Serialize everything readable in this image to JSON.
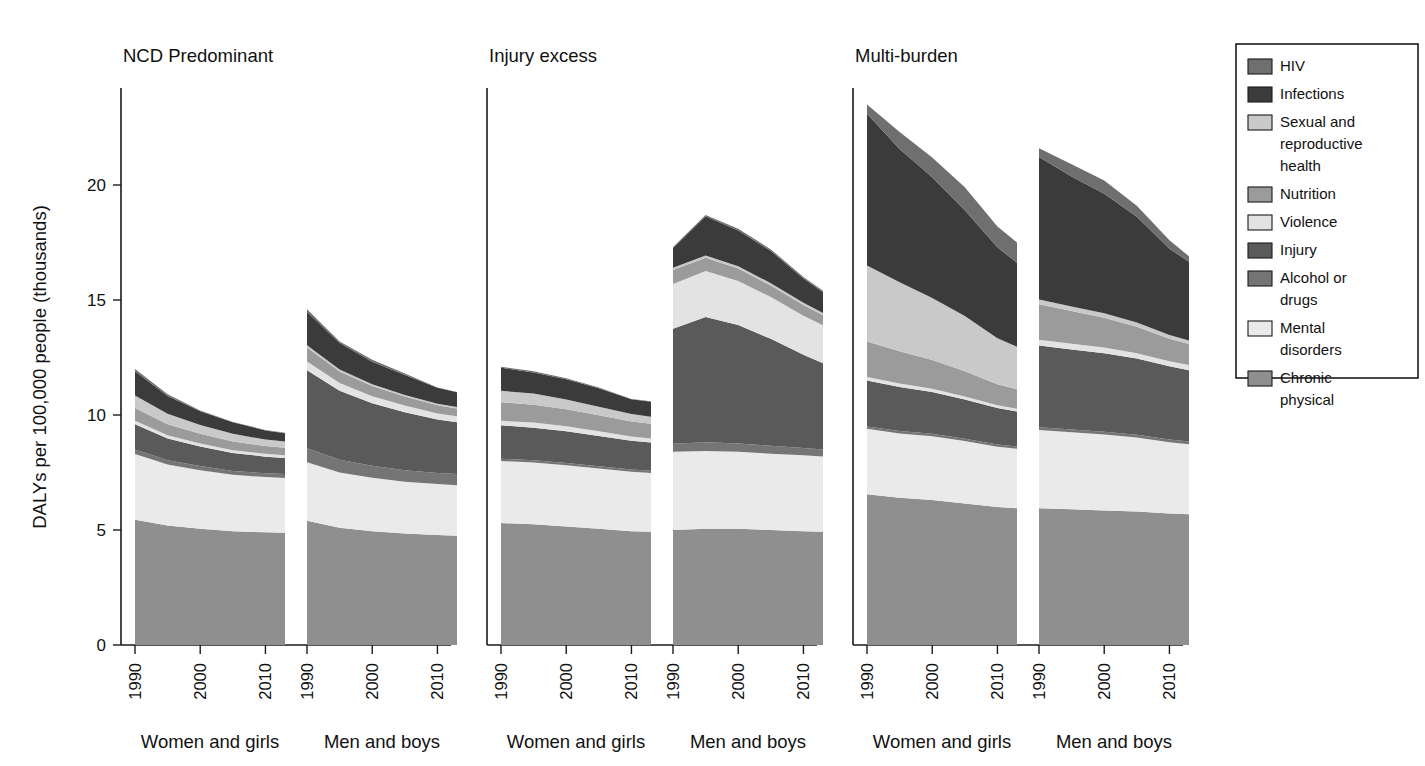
{
  "figure": {
    "ylabel": "DALYs per 100,000 people (thousands)",
    "panels": [
      {
        "title": "NCD Predominant",
        "groups": [
          "Women and girls",
          "Men and boys"
        ]
      },
      {
        "title": "Injury excess",
        "groups": [
          "Women and girls",
          "Men and boys"
        ]
      },
      {
        "title": "Multi-burden",
        "groups": [
          "Women and girls",
          "Men and boys"
        ]
      }
    ],
    "xticklabels": [
      "1990",
      "2000",
      "2010"
    ],
    "yticklabels": [
      "0",
      "5",
      "10",
      "15",
      "20"
    ]
  },
  "legend": {
    "title": "",
    "items": [
      {
        "label": "HIV",
        "color": "#6f6f6f"
      },
      {
        "label": "Infections",
        "color": "#3b3b3b"
      },
      {
        "label": "Sexual and reproductive health",
        "color": "#c9c9c9"
      },
      {
        "label": "Nutrition",
        "color": "#9b9b9b"
      },
      {
        "label": "Violence",
        "color": "#e3e3e3"
      },
      {
        "label": "Injury",
        "color": "#5a5a5a"
      },
      {
        "label": "Alcohol or drugs",
        "color": "#757575"
      },
      {
        "label": "Mental disorders",
        "color": "#eaeaea"
      },
      {
        "label": "Chronic physical",
        "color": "#8f8f8f"
      }
    ]
  },
  "chart_data": {
    "type": "area",
    "title": "",
    "xlabel": "",
    "ylabel": "DALYs per 100,000 people (thousands)",
    "ylim": [
      0,
      24
    ],
    "yticks": [
      0,
      5,
      10,
      15,
      20
    ],
    "grid": false,
    "legend_position": "right",
    "stack_order_bottom_to_top": [
      "Chronic physical",
      "Mental disorders",
      "Alcohol or drugs",
      "Injury",
      "Violence",
      "Nutrition",
      "Sexual and reproductive health",
      "Infections",
      "HIV"
    ],
    "x": [
      1990,
      1995,
      2000,
      2005,
      2010,
      2013
    ],
    "xticks": [
      1990,
      2000,
      2010
    ],
    "panels": [
      {
        "name": "NCD Predominant",
        "groups": [
          {
            "name": "Women and girls",
            "total": [
              12.0,
              10.9,
              10.2,
              9.7,
              9.3,
              9.15
            ],
            "series": [
              {
                "name": "Chronic physical",
                "values": [
                  5.45,
                  5.2,
                  5.05,
                  4.95,
                  4.9,
                  4.88
                ]
              },
              {
                "name": "Mental disorders",
                "values": [
                  2.85,
                  2.65,
                  2.55,
                  2.45,
                  2.4,
                  2.38
                ]
              },
              {
                "name": "Alcohol or drugs",
                "values": [
                  0.2,
                  0.18,
                  0.18,
                  0.17,
                  0.17,
                  0.17
                ]
              },
              {
                "name": "Injury",
                "values": [
                  1.1,
                  0.95,
                  0.85,
                  0.78,
                  0.72,
                  0.7
                ]
              },
              {
                "name": "Violence",
                "values": [
                  0.15,
                  0.14,
                  0.13,
                  0.12,
                  0.12,
                  0.12
                ]
              },
              {
                "name": "Nutrition",
                "values": [
                  0.55,
                  0.48,
                  0.42,
                  0.38,
                  0.34,
                  0.33
                ]
              },
              {
                "name": "Sexual and reproductive health",
                "values": [
                  0.55,
                  0.45,
                  0.38,
                  0.33,
                  0.28,
                  0.27
                ]
              },
              {
                "name": "Infections",
                "values": [
                  1.05,
                  0.78,
                  0.6,
                  0.5,
                  0.4,
                  0.36
                ]
              },
              {
                "name": "HIV",
                "values": [
                  0.1,
                  0.07,
                  0.04,
                  0.02,
                  0.02,
                  0.02
                ]
              }
            ]
          },
          {
            "name": "Men and boys",
            "total": [
              14.6,
              13.2,
              12.4,
              11.8,
              11.2,
              11.0
            ],
            "series": [
              {
                "name": "Chronic physical",
                "values": [
                  5.4,
                  5.1,
                  4.95,
                  4.85,
                  4.78,
                  4.75
                ]
              },
              {
                "name": "Mental disorders",
                "values": [
                  2.55,
                  2.4,
                  2.32,
                  2.25,
                  2.22,
                  2.2
                ]
              },
              {
                "name": "Alcohol or drugs",
                "values": [
                  0.6,
                  0.55,
                  0.52,
                  0.5,
                  0.48,
                  0.48
                ]
              },
              {
                "name": "Injury",
                "values": [
                  3.4,
                  3.0,
                  2.72,
                  2.52,
                  2.32,
                  2.25
                ]
              },
              {
                "name": "Violence",
                "values": [
                  0.38,
                  0.34,
                  0.31,
                  0.29,
                  0.27,
                  0.27
                ]
              },
              {
                "name": "Nutrition",
                "values": [
                  0.6,
                  0.5,
                  0.44,
                  0.39,
                  0.35,
                  0.33
                ]
              },
              {
                "name": "Sexual and reproductive health",
                "values": [
                  0.1,
                  0.09,
                  0.08,
                  0.07,
                  0.07,
                  0.07
                ]
              },
              {
                "name": "Infections",
                "values": [
                  1.45,
                  1.15,
                  0.98,
                  0.87,
                  0.7,
                  0.64
                ]
              },
              {
                "name": "HIV",
                "values": [
                  0.12,
                  0.07,
                  0.08,
                  0.06,
                  0.01,
                  0.01
                ]
              }
            ]
          }
        ]
      },
      {
        "name": "Injury excess",
        "groups": [
          {
            "name": "Women and girls",
            "total": [
              12.1,
              11.9,
              11.6,
              11.2,
              10.7,
              10.6
            ],
            "series": [
              {
                "name": "Chronic physical",
                "values": [
                  5.3,
                  5.25,
                  5.15,
                  5.05,
                  4.95,
                  4.92
                ]
              },
              {
                "name": "Mental disorders",
                "values": [
                  2.7,
                  2.68,
                  2.66,
                  2.62,
                  2.58,
                  2.56
                ]
              },
              {
                "name": "Alcohol or drugs",
                "values": [
                  0.1,
                  0.1,
                  0.1,
                  0.1,
                  0.1,
                  0.1
                ]
              },
              {
                "name": "Injury",
                "values": [
                  1.45,
                  1.42,
                  1.38,
                  1.32,
                  1.25,
                  1.22
                ]
              },
              {
                "name": "Violence",
                "values": [
                  0.2,
                  0.22,
                  0.22,
                  0.2,
                  0.18,
                  0.18
                ]
              },
              {
                "name": "Nutrition",
                "values": [
                  0.8,
                  0.78,
                  0.74,
                  0.7,
                  0.66,
                  0.64
                ]
              },
              {
                "name": "Sexual and reproductive health",
                "values": [
                  0.5,
                  0.48,
                  0.42,
                  0.37,
                  0.32,
                  0.3
                ]
              },
              {
                "name": "Infections",
                "values": [
                  1.0,
                  0.92,
                  0.88,
                  0.8,
                  0.64,
                  0.66
                ]
              },
              {
                "name": "HIV",
                "values": [
                  0.05,
                  0.05,
                  0.05,
                  0.04,
                  0.02,
                  0.02
                ]
              }
            ]
          },
          {
            "name": "Men and boys",
            "total": [
              17.3,
              18.7,
              18.1,
              17.2,
              16.0,
              15.4
            ],
            "series": [
              {
                "name": "Chronic physical",
                "values": [
                  5.0,
                  5.05,
                  5.05,
                  5.0,
                  4.95,
                  4.92
                ]
              },
              {
                "name": "Mental disorders",
                "values": [
                  3.4,
                  3.38,
                  3.35,
                  3.32,
                  3.3,
                  3.28
                ]
              },
              {
                "name": "Alcohol or drugs",
                "values": [
                  0.35,
                  0.38,
                  0.36,
                  0.34,
                  0.32,
                  0.3
                ]
              },
              {
                "name": "Injury",
                "values": [
                  5.0,
                  5.45,
                  5.15,
                  4.65,
                  4.05,
                  3.75
                ]
              },
              {
                "name": "Violence",
                "values": [
                  1.95,
                  2.0,
                  1.92,
                  1.82,
                  1.7,
                  1.65
                ]
              },
              {
                "name": "Nutrition",
                "values": [
                  0.6,
                  0.58,
                  0.54,
                  0.5,
                  0.46,
                  0.44
                ]
              },
              {
                "name": "Sexual and reproductive health",
                "values": [
                  0.1,
                  0.1,
                  0.1,
                  0.1,
                  0.1,
                  0.1
                ]
              },
              {
                "name": "Infections",
                "values": [
                  0.85,
                  1.7,
                  1.55,
                  1.4,
                  1.05,
                  0.9
                ]
              },
              {
                "name": "HIV",
                "values": [
                  0.05,
                  0.06,
                  0.08,
                  0.07,
                  0.07,
                  0.06
                ]
              }
            ]
          }
        ]
      },
      {
        "name": "Multi-burden",
        "groups": [
          {
            "name": "Women and girls",
            "total": [
              23.5,
              22.3,
              21.2,
              19.9,
              18.2,
              17.5
            ],
            "series": [
              {
                "name": "Chronic physical",
                "values": [
                  6.55,
                  6.4,
                  6.3,
                  6.15,
                  6.0,
                  5.95
                ]
              },
              {
                "name": "Mental disorders",
                "values": [
                  2.85,
                  2.8,
                  2.78,
                  2.72,
                  2.62,
                  2.58
                ]
              },
              {
                "name": "Alcohol or drugs",
                "values": [
                  0.1,
                  0.1,
                  0.1,
                  0.1,
                  0.1,
                  0.1
                ]
              },
              {
                "name": "Injury",
                "values": [
                  2.0,
                  1.92,
                  1.82,
                  1.7,
                  1.58,
                  1.52
                ]
              },
              {
                "name": "Violence",
                "values": [
                  0.15,
                  0.15,
                  0.14,
                  0.13,
                  0.12,
                  0.12
                ]
              },
              {
                "name": "Nutrition",
                "values": [
                  1.55,
                  1.4,
                  1.25,
                  1.1,
                  0.92,
                  0.85
                ]
              },
              {
                "name": "Sexual and reproductive health",
                "values": [
                  3.3,
                  3.0,
                  2.7,
                  2.4,
                  2.0,
                  1.85
                ]
              },
              {
                "name": "Infections",
                "values": [
                  6.6,
                  5.8,
                  5.25,
                  4.6,
                  3.95,
                  3.65
                ]
              },
              {
                "name": "HIV",
                "values": [
                  0.4,
                  0.73,
                  0.86,
                  1.0,
                  0.91,
                  0.88
                ]
              }
            ]
          },
          {
            "name": "Men and boys",
            "total": [
              21.6,
              20.9,
              20.2,
              19.1,
              17.6,
              16.9
            ],
            "series": [
              {
                "name": "Chronic physical",
                "values": [
                  5.95,
                  5.9,
                  5.85,
                  5.8,
                  5.72,
                  5.68
                ]
              },
              {
                "name": "Mental disorders",
                "values": [
                  3.4,
                  3.35,
                  3.3,
                  3.22,
                  3.1,
                  3.05
                ]
              },
              {
                "name": "Alcohol or drugs",
                "values": [
                  0.12,
                  0.12,
                  0.12,
                  0.12,
                  0.12,
                  0.12
                ]
              },
              {
                "name": "Injury",
                "values": [
                  3.55,
                  3.48,
                  3.42,
                  3.32,
                  3.18,
                  3.1
                ]
              },
              {
                "name": "Violence",
                "values": [
                  0.25,
                  0.25,
                  0.24,
                  0.23,
                  0.22,
                  0.22
                ]
              },
              {
                "name": "Nutrition",
                "values": [
                  1.55,
                  1.42,
                  1.3,
                  1.15,
                  0.98,
                  0.92
                ]
              },
              {
                "name": "Sexual and reproductive health",
                "values": [
                  0.2,
                  0.2,
                  0.19,
                  0.18,
                  0.16,
                  0.15
                ]
              },
              {
                "name": "Infections",
                "values": [
                  6.2,
                  5.65,
                  5.2,
                  4.6,
                  3.75,
                  3.42
                ]
              },
              {
                "name": "HIV",
                "values": [
                  0.38,
                  0.53,
                  0.58,
                  0.48,
                  0.37,
                  0.24
                ]
              }
            ]
          }
        ]
      }
    ]
  }
}
